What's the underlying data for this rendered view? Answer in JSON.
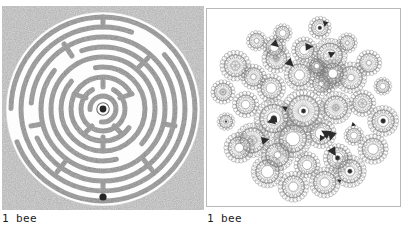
{
  "page": {
    "background_color": "#ffffff",
    "width": 406,
    "height": 232,
    "layout": "two side-by-side square image panels, each with a caption beneath"
  },
  "panels": [
    {
      "id": "left",
      "name": "noisy-labyrinth-panel",
      "artwork_kind": "labyrinth",
      "description": "Classical circular labyrinth rendered in coarse gray stipple noise; white winding path, dark dot marker at the centre and at the bottom entrance.",
      "caption": "1 bee",
      "background_color": "#c9c9c9",
      "ink_color": "#6e6e6e",
      "marker_color": "#2a2a2a",
      "path_color": "#f7f7f7",
      "ring_count": 9,
      "center_marker": true,
      "entrance_marker": true,
      "frame": false
    },
    {
      "id": "right",
      "name": "rosette-mandala-panel",
      "artwork_kind": "spirograph-rosette-cluster",
      "description": "Circular mandala built from about forty overlapping spirograph rosettes of varying size, fine gray line work on white, a few solid dark accent wedges between rosettes.",
      "caption": "1 bee",
      "background_color": "#ffffff",
      "border_color": "#b9b9b9",
      "ink_color": "#7b7b7b",
      "accent_color": "#2b2b2b",
      "rosette_count": 41,
      "frame": true
    }
  ],
  "captions": {
    "left": "1 bee",
    "right": "1 bee"
  }
}
